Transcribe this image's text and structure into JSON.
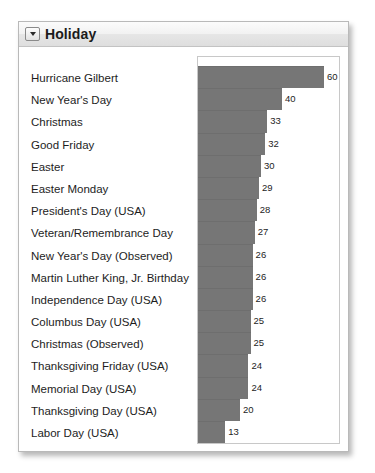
{
  "panel": {
    "title": "Holiday",
    "collapse_icon": "triangle-down-icon"
  },
  "chart_data": {
    "type": "bar",
    "orientation": "horizontal",
    "title": "Holiday",
    "xlabel": "",
    "ylabel": "",
    "grid": false,
    "legend": false,
    "xlim": [
      0,
      64
    ],
    "categories": [
      "Hurricane Gilbert",
      "New Year's Day",
      "Christmas",
      "Good Friday",
      "Easter",
      "Easter Monday",
      "President's Day (USA)",
      "Veteran/Remembrance Day",
      "New Year's Day (Observed)",
      "Martin Luther King, Jr. Birthday",
      "Independence Day (USA)",
      "Columbus Day (USA)",
      "Christmas (Observed)",
      "Thanksgiving Friday (USA)",
      "Memorial Day (USA)",
      "Thanksgiving Day (USA)",
      "Labor Day (USA)"
    ],
    "values": [
      60,
      40,
      33,
      32,
      30,
      29,
      28,
      27,
      26,
      26,
      26,
      25,
      25,
      24,
      24,
      20,
      13
    ],
    "bar_color": "#767676",
    "max_value": 60
  }
}
